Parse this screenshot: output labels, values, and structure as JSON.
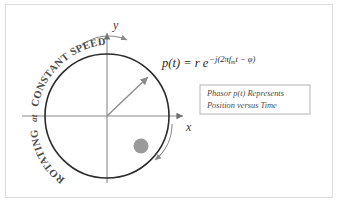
{
  "figure": {
    "background_color": "#ffffff",
    "frame_color": "#dcdcdc"
  },
  "axes": {
    "x_label": "x",
    "y_label": "y",
    "axis_color": "#8a8a8a",
    "origin": {
      "x": 107,
      "y": 116
    }
  },
  "circle": {
    "center_x": 107,
    "center_y": 116,
    "radius": 62,
    "stroke_color": "#2b2b2b",
    "stroke_width": 1.6
  },
  "phasor": {
    "label": "p(t)  =  r e",
    "exponent_prefix": "−j(2πf",
    "exponent_subscript": "m",
    "exponent_suffix": "t − φ)",
    "formula_plain": "p(t) = r e^{-j(2πf_m t - φ)}",
    "arrow_color": "#8a8a8a",
    "angle_degrees": 45,
    "tip_x": 148,
    "tip_y": 77
  },
  "moving_point": {
    "name": "position-dot",
    "cx": 141,
    "cy": 146,
    "r": 7.5,
    "color": "#9a9a9a"
  },
  "curved_label": {
    "text_main": "ROTATING",
    "text_connector": "at",
    "text_tail": "CONSTANT SPEED",
    "full_text": "ROTATING at CONSTANT SPEED",
    "color": "#4a4a4a"
  },
  "rotation_arrows": {
    "top_arrow_name": "rotation-arrow-top",
    "bottom_arrow_name": "rotation-arrow-bottom",
    "color": "#8a8a8a",
    "direction": "clockwise"
  },
  "callout_box": {
    "line1": "Phasor p(t) Represents",
    "line2": "Position versus Time",
    "border_color": "#b4b4b4",
    "text_color": "#4a4a4a",
    "x": 200,
    "y": 85,
    "width": 110,
    "height": 29
  }
}
